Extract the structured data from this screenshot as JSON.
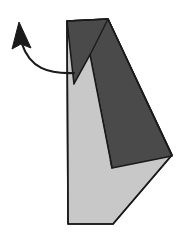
{
  "figure": {
    "canvas": {
      "width": 194,
      "height": 248,
      "background": "#ffffff"
    },
    "colors": {
      "paper_front": "#c8c8c8",
      "paper_back": "#4a4a4a",
      "outline": "#1a1a1a",
      "crease": "#1a1a1a",
      "arrow": "#1a1a1a",
      "background": "#ffffff"
    },
    "shapes": {
      "base_sheet": {
        "label": "light gray paper front face",
        "fill": "#c8c8c8",
        "stroke": "#1a1a1a",
        "stroke_width": 1.6,
        "points": "67,21 108,19 172,155 113,224 68,224"
      },
      "folded_flap": {
        "label": "dark gray paper reverse face flap",
        "fill": "#4a4a4a",
        "stroke": "#1a1a1a",
        "stroke_width": 1.6,
        "points": "67,21 108,19 172,156 112,168 90,55 74,84"
      },
      "wedge_highlight": {
        "label": "light gray wedge between flap layers",
        "fill": "#c8c8c8",
        "stroke": "none",
        "points": "90,55 74,84 100,160 110,160"
      }
    },
    "creases": [
      {
        "label": "flap fold crease",
        "d": "M108,19 L90,55",
        "stroke": "#1a1a1a",
        "stroke_width": 1.4
      },
      {
        "label": "wedge left crease",
        "d": "M90,55 L74,84",
        "stroke": "#1a1a1a",
        "stroke_width": 1.4
      },
      {
        "label": "wedge right crease",
        "d": "M90,55 L112,168",
        "stroke": "#1a1a1a",
        "stroke_width": 1.4
      }
    ],
    "arrow": {
      "label": "fold direction arrow pointing up and away",
      "curve_d": "M74,73 C48,74 30,68 22,44",
      "stroke": "#1a1a1a",
      "stroke_width": 2.2,
      "head_points": "19,22 31,48 21,44 12,49",
      "head_fill": "#1a1a1a",
      "tail_x": 74,
      "tail_y": 73,
      "tip_x": 19,
      "tip_y": 22
    }
  }
}
